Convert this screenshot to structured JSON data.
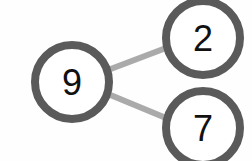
{
  "diagram": {
    "type": "number-bond",
    "whole": {
      "value": "9"
    },
    "parts": [
      {
        "value": "2"
      },
      {
        "value": "7"
      }
    ],
    "colors": {
      "circle_stroke": "#5a5a5a",
      "connector": "#aaaaaa",
      "text": "#111111"
    }
  }
}
